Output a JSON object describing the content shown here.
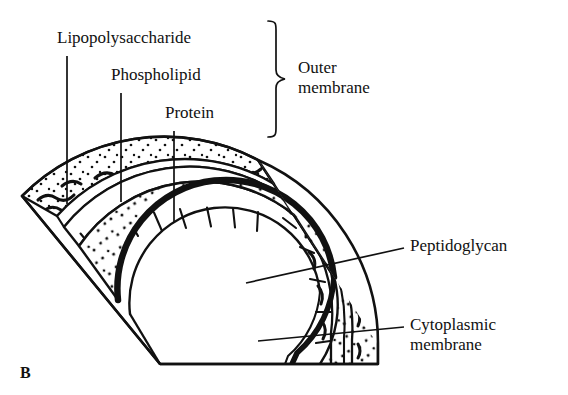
{
  "figure": {
    "panel_letter": "B",
    "caption_title": "Gram-negative cell envelope cross-section"
  },
  "labels": {
    "lipopolysaccharide": "Lipopolysaccharide",
    "phospholipid": "Phospholipid",
    "protein": "Protein",
    "outer_membrane_line1": "Outer",
    "outer_membrane_line2": "membrane",
    "peptidoglycan": "Peptidoglycan",
    "cytoplasmic_line1": "Cytoplasmic",
    "cytoplasmic_line2": "membrane"
  },
  "icons": {
    "brace": "curly-brace-right",
    "leader": "leader-line"
  },
  "colors": {
    "ink": "#111111",
    "background": "#ffffff",
    "stipple": "#111111",
    "squiggle": "#111111"
  },
  "structure": {
    "layers": [
      {
        "name": "lipopolysaccharide-layer",
        "description": "outer stippled band with wavy LPS chains"
      },
      {
        "name": "phospholipid-layer",
        "description": "inner leaflet of outer membrane"
      },
      {
        "name": "protein-layer",
        "description": "band of rectangular protein blocks"
      },
      {
        "name": "periplasm-peptidoglycan",
        "description": "wide stippled region"
      },
      {
        "name": "cytoplasmic-membrane",
        "description": "thick dark double-line arc"
      },
      {
        "name": "cytoplasm",
        "description": "white interior"
      }
    ]
  }
}
